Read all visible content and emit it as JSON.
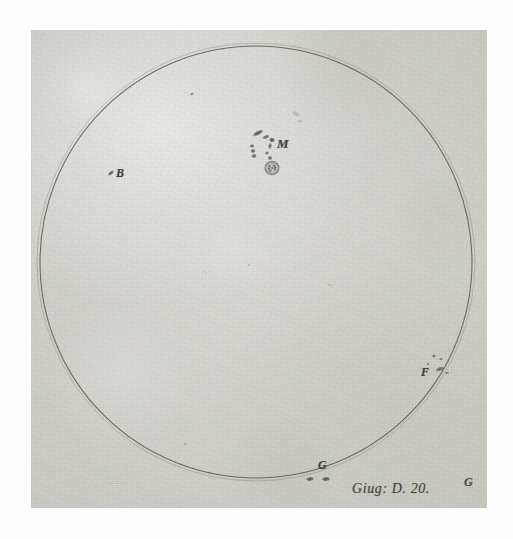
{
  "artifact": {
    "kind": "historical-sunspot-drawing",
    "medium_description": "ink drawing on aged paper",
    "caption": "Giug: D. 20.",
    "faint_inscription": "....."
  },
  "disk": {
    "name": "solar-disk",
    "center_x": 256,
    "center_y": 262,
    "radius": 216,
    "outline_color": "#5a574f",
    "inner_outline_offset": 3
  },
  "palette": {
    "paper": "#d4d3cd",
    "ink": "#4a4840",
    "ink_light": "#6d6a62",
    "border": "#ffffff"
  },
  "labels": [
    {
      "id": "M",
      "text": "M",
      "x": 283,
      "y": 145,
      "note": "main central group"
    },
    {
      "id": "B",
      "text": "B",
      "x": 121,
      "y": 173,
      "note": "left small spot"
    },
    {
      "id": "F",
      "text": "F",
      "x": 426,
      "y": 372,
      "note": "lower-right group"
    },
    {
      "id": "G1",
      "text": "G",
      "x": 323,
      "y": 465,
      "note": "bottom pair"
    },
    {
      "id": "G2",
      "text": "G",
      "x": 469,
      "y": 482,
      "note": "edge marker near limb"
    }
  ],
  "spot_groups": [
    {
      "id": "M",
      "label": "M",
      "description": "large central group: streak, small cluster, bright ringed spot",
      "spots": [
        {
          "cx": 258,
          "cy": 133,
          "rx": 6.5,
          "ry": 2.4,
          "rot": -28,
          "opacity": 0.8
        },
        {
          "cx": 266,
          "cy": 137,
          "rx": 4.0,
          "ry": 2.0,
          "rot": -20,
          "opacity": 0.72
        },
        {
          "cx": 272,
          "cy": 140,
          "rx": 3.2,
          "ry": 2.6,
          "rot": 10,
          "opacity": 0.8
        },
        {
          "cx": 270,
          "cy": 146,
          "rx": 2.0,
          "ry": 3.4,
          "rot": 8,
          "opacity": 0.7
        },
        {
          "cx": 252,
          "cy": 146,
          "rx": 2.4,
          "ry": 2.0,
          "rot": 0,
          "opacity": 0.74
        },
        {
          "cx": 253,
          "cy": 151,
          "rx": 2.6,
          "ry": 2.2,
          "rot": 0,
          "opacity": 0.76
        },
        {
          "cx": 254,
          "cy": 156,
          "rx": 2.8,
          "ry": 2.4,
          "rot": 0,
          "opacity": 0.72
        },
        {
          "cx": 267,
          "cy": 153,
          "rx": 2.2,
          "ry": 2.0,
          "rot": 0,
          "opacity": 0.66
        },
        {
          "cx": 270,
          "cy": 158,
          "rx": 2.6,
          "ry": 2.2,
          "rot": 0,
          "opacity": 0.7
        },
        {
          "cx": 272,
          "cy": 168,
          "rx": 7.0,
          "ry": 6.6,
          "rot": 0,
          "opacity": 0.55,
          "ring": true
        }
      ]
    },
    {
      "id": "B",
      "label": "B",
      "description": "single elongated spot left of centre",
      "spots": [
        {
          "cx": 111,
          "cy": 173,
          "rx": 4.0,
          "ry": 1.8,
          "rot": -40,
          "opacity": 0.82
        }
      ]
    },
    {
      "id": "F",
      "label": "F",
      "description": "scattered small spots lower right",
      "spots": [
        {
          "cx": 434,
          "cy": 356,
          "rx": 2.2,
          "ry": 1.8,
          "rot": 0,
          "opacity": 0.66
        },
        {
          "cx": 441,
          "cy": 359,
          "rx": 2.0,
          "ry": 1.6,
          "rot": 0,
          "opacity": 0.6
        },
        {
          "cx": 428,
          "cy": 364,
          "rx": 1.4,
          "ry": 1.2,
          "rot": 0,
          "opacity": 0.55
        },
        {
          "cx": 440,
          "cy": 369,
          "rx": 5.0,
          "ry": 2.2,
          "rot": -18,
          "opacity": 0.7
        },
        {
          "cx": 447,
          "cy": 373,
          "rx": 2.2,
          "ry": 1.6,
          "rot": 0,
          "opacity": 0.55
        }
      ]
    },
    {
      "id": "G",
      "label": "G",
      "description": "pair of spots near bottom limb",
      "spots": [
        {
          "cx": 310,
          "cy": 479,
          "rx": 4.4,
          "ry": 2.2,
          "rot": -6,
          "opacity": 0.8
        },
        {
          "cx": 326,
          "cy": 479,
          "rx": 4.6,
          "ry": 2.4,
          "rot": -4,
          "opacity": 0.8
        }
      ]
    }
  ],
  "stray_marks": [
    {
      "cx": 192,
      "cy": 94,
      "rx": 2.2,
      "ry": 1.6,
      "rot": -25,
      "opacity": 0.5
    },
    {
      "cx": 185,
      "cy": 92,
      "rx": 1.0,
      "ry": 0.8,
      "rot": 0,
      "opacity": 0.35
    },
    {
      "cx": 296,
      "cy": 114,
      "rx": 5.0,
      "ry": 2.6,
      "rot": 25,
      "opacity": 0.2
    },
    {
      "cx": 300,
      "cy": 121,
      "rx": 3.0,
      "ry": 2.0,
      "rot": 15,
      "opacity": 0.16
    },
    {
      "cx": 249,
      "cy": 265,
      "rx": 1.4,
      "ry": 0.9,
      "rot": 20,
      "opacity": 0.3
    },
    {
      "cx": 330,
      "cy": 285,
      "rx": 3.2,
      "ry": 0.9,
      "rot": 35,
      "opacity": 0.22
    },
    {
      "cx": 205,
      "cy": 272,
      "rx": 2.6,
      "ry": 0.7,
      "rot": 15,
      "opacity": 0.18
    },
    {
      "cx": 185,
      "cy": 444,
      "rx": 2.0,
      "ry": 1.6,
      "rot": 0,
      "opacity": 0.18
    },
    {
      "cx": 264,
      "cy": 286,
      "rx": 1.2,
      "ry": 0.8,
      "rot": 0,
      "opacity": 0.22
    },
    {
      "cx": 150,
      "cy": 330,
      "rx": 1.1,
      "ry": 0.8,
      "rot": 0,
      "opacity": 0.18
    }
  ]
}
